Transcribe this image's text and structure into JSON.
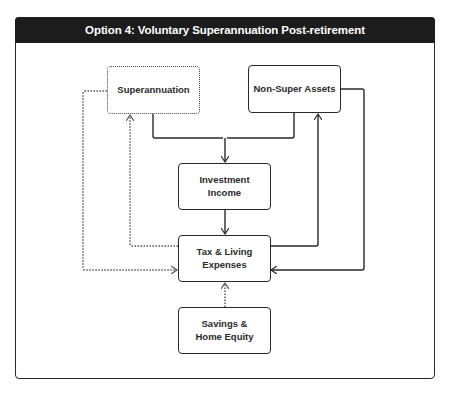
{
  "title": "Option 4: Voluntary Superannuation Post-retirement",
  "nodes": {
    "superannuation": {
      "label": "Superannuation",
      "style": "dotted"
    },
    "non_super_assets": {
      "label": "Non-Super Assets",
      "style": "solid"
    },
    "investment_income": {
      "label": "Investment Income",
      "style": "solid"
    },
    "tax_living_expenses": {
      "label": "Tax & Living Expenses",
      "style": "solid"
    },
    "savings_home_equity": {
      "label": "Savings & Home Equity",
      "style": "solid"
    }
  },
  "edges": [
    {
      "from": "superannuation",
      "to": "investment_income",
      "style": "solid"
    },
    {
      "from": "non_super_assets",
      "to": "investment_income",
      "style": "solid"
    },
    {
      "from": "investment_income",
      "to": "tax_living_expenses",
      "style": "solid"
    },
    {
      "from": "tax_living_expenses",
      "to": "superannuation",
      "style": "dotted"
    },
    {
      "from": "superannuation",
      "to": "tax_living_expenses",
      "style": "dotted"
    },
    {
      "from": "tax_living_expenses",
      "to": "non_super_assets",
      "style": "solid"
    },
    {
      "from": "non_super_assets",
      "to": "tax_living_expenses",
      "style": "solid"
    },
    {
      "from": "savings_home_equity",
      "to": "tax_living_expenses",
      "style": "dotted"
    }
  ],
  "colors": {
    "header_bg": "#1c1c1c",
    "header_text": "#ffffff",
    "stroke": "#2a2a2a"
  }
}
